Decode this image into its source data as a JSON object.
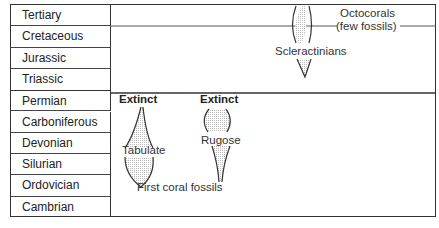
{
  "periods": [
    "Tertiary",
    "Cretaceous",
    "Jurassic",
    "Triassic",
    "Permian",
    "Carboniferous",
    "Devonian",
    "Silurian",
    "Ordovician",
    "Cambrian"
  ],
  "labels": {
    "octocorals": "Octocorals",
    "octocorals_note": "(few fossils)",
    "scleractinians": "Scleractinians",
    "extinct_tabulate": "Extinct",
    "extinct_rugose": "Extinct",
    "tabulate": "Tabulate",
    "rugose": "Rugose",
    "first_fossils": "First coral fossils"
  },
  "colors": {
    "stipple": "#d9d9d9",
    "line": "#333333"
  }
}
